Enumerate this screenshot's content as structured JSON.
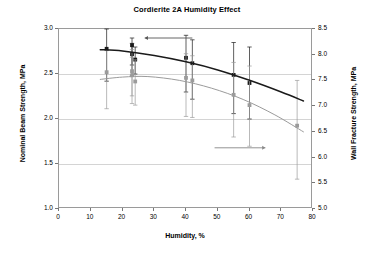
{
  "chart_data": {
    "type": "scatter",
    "title": "Cordierite 2A Humidity Effect",
    "xlabel": "Humidity, %",
    "ylabel": "Nominal Beam Strength, MPa",
    "ylabel_right": "Wall Fracture Strength, MPa",
    "xlim": [
      0,
      80
    ],
    "ylim": [
      1.0,
      3.0
    ],
    "ylim_right": [
      5.0,
      8.5
    ],
    "xticks": [
      0,
      10,
      20,
      30,
      40,
      50,
      60,
      70,
      80
    ],
    "xtick_labels": [
      "0",
      "10",
      "20",
      "30",
      "40",
      "50",
      "60",
      "70",
      "80"
    ],
    "yticks": [
      1.0,
      1.5,
      2.0,
      2.5,
      3.0
    ],
    "ytick_labels": [
      "1.0",
      "1.5",
      "2.0",
      "2.5",
      "3.0"
    ],
    "yticks_right": [
      5.0,
      5.5,
      6.0,
      6.5,
      7.0,
      7.5,
      8.0,
      8.5
    ],
    "ytick_labels_right": [
      "5.0",
      "5.5",
      "6.0",
      "6.5",
      "7.0",
      "7.5",
      "8.0",
      "8.5"
    ],
    "grid": "horizontal",
    "legend": "none",
    "series": [
      {
        "name": "Nominal Beam Strength",
        "axis": "left",
        "color": "#1a1a1a",
        "marker": "square",
        "points": [
          {
            "x": 15,
            "y": 2.78,
            "err_low": 2.42,
            "err_high": 3.0
          },
          {
            "x": 23,
            "y": 2.82,
            "err_low": 2.48,
            "err_high": 2.9
          },
          {
            "x": 23,
            "y": 2.72,
            "err_low": 2.6,
            "err_high": 2.84
          },
          {
            "x": 24,
            "y": 2.66,
            "err_low": 2.5,
            "err_high": 2.8
          },
          {
            "x": 40,
            "y": 2.68,
            "err_low": 2.3,
            "err_high": 2.93
          },
          {
            "x": 42,
            "y": 2.62,
            "err_low": 2.22,
            "err_high": 2.88
          },
          {
            "x": 55,
            "y": 2.49,
            "err_low": 2.06,
            "err_high": 2.85
          },
          {
            "x": 60,
            "y": 2.4,
            "err_low": 2.0,
            "err_high": 2.8
          }
        ],
        "fit_curve": [
          {
            "x": 13,
            "y": 2.77
          },
          {
            "x": 20,
            "y": 2.755
          },
          {
            "x": 30,
            "y": 2.705
          },
          {
            "x": 40,
            "y": 2.635
          },
          {
            "x": 50,
            "y": 2.545
          },
          {
            "x": 60,
            "y": 2.43
          },
          {
            "x": 70,
            "y": 2.3
          },
          {
            "x": 77,
            "y": 2.2
          }
        ]
      },
      {
        "name": "Wall Fracture Strength",
        "axis": "right",
        "color": "#9b9b9b",
        "marker": "square",
        "points": [
          {
            "x": 15,
            "y": 7.66,
            "err_low": 6.95,
            "err_high": 8.08
          },
          {
            "x": 23,
            "y": 7.68,
            "err_low": 7.05,
            "err_high": 8.1
          },
          {
            "x": 23,
            "y": 7.6,
            "err_low": 7.2,
            "err_high": 7.95
          },
          {
            "x": 24,
            "y": 7.48,
            "err_low": 7.02,
            "err_high": 7.9
          },
          {
            "x": 40,
            "y": 7.55,
            "err_low": 6.8,
            "err_high": 8.02
          },
          {
            "x": 42,
            "y": 7.5,
            "err_low": 6.78,
            "err_high": 7.98
          },
          {
            "x": 55,
            "y": 7.22,
            "err_low": 6.4,
            "err_high": 7.85
          },
          {
            "x": 60,
            "y": 7.02,
            "err_low": 6.22,
            "err_high": 7.78
          },
          {
            "x": 75,
            "y": 6.62,
            "err_low": 5.58,
            "err_high": 7.5
          }
        ],
        "fit_curve": [
          {
            "x": 13,
            "y": 7.52
          },
          {
            "x": 20,
            "y": 7.565
          },
          {
            "x": 28,
            "y": 7.575
          },
          {
            "x": 38,
            "y": 7.5
          },
          {
            "x": 48,
            "y": 7.35
          },
          {
            "x": 58,
            "y": 7.13
          },
          {
            "x": 68,
            "y": 6.83
          },
          {
            "x": 77,
            "y": 6.5
          }
        ]
      }
    ],
    "annotations": [
      {
        "name": "left-axis-arrow",
        "direction": "left",
        "x_start": 42,
        "x_end": 27,
        "y": 2.9
      },
      {
        "name": "right-axis-arrow",
        "direction": "right",
        "x_start": 49,
        "x_end": 65,
        "y": 1.68
      }
    ]
  }
}
